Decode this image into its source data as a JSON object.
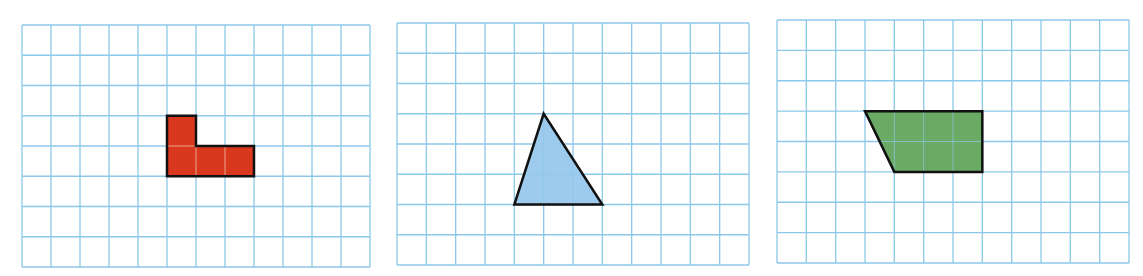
{
  "colors": {
    "grid_line": "#8cc8e8",
    "outline": "#111111",
    "background": "#ffffff"
  },
  "panels": [
    {
      "name": "grid-panel-1",
      "x": 22,
      "y": 25,
      "width": 348,
      "height": 242,
      "cols": 12,
      "rows": 8,
      "shape": {
        "type": "L-shape polygon",
        "fill": "#d9381e",
        "points_grid": [
          [
            5,
            3
          ],
          [
            6,
            3
          ],
          [
            6,
            4
          ],
          [
            8,
            4
          ],
          [
            8,
            5
          ],
          [
            5,
            5
          ]
        ],
        "inner_lines_grid": [
          [
            [
              5,
              4
            ],
            [
              6,
              4
            ]
          ],
          [
            [
              6,
              4
            ],
            [
              6,
              5
            ]
          ],
          [
            [
              7,
              4
            ],
            [
              7,
              5
            ]
          ]
        ]
      }
    },
    {
      "name": "grid-panel-2",
      "x": 397,
      "y": 23,
      "width": 352,
      "height": 242,
      "cols": 12,
      "rows": 8,
      "shape": {
        "type": "triangle",
        "fill": "#9ccbee",
        "points_grid": [
          [
            5,
            3
          ],
          [
            7,
            6
          ],
          [
            4,
            6
          ]
        ],
        "inner_lines_grid": []
      }
    },
    {
      "name": "grid-panel-3",
      "x": 777,
      "y": 20,
      "width": 352,
      "height": 243,
      "cols": 12,
      "rows": 8,
      "shape": {
        "type": "trapezoid",
        "fill": "#6aaa64",
        "points_grid": [
          [
            3,
            3
          ],
          [
            7,
            3
          ],
          [
            7,
            5
          ],
          [
            4,
            5
          ]
        ],
        "inner_lines_grid": []
      }
    }
  ]
}
